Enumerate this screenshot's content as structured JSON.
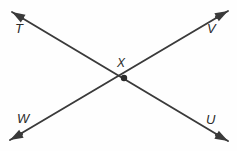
{
  "figure": {
    "type": "geometry-diagram",
    "background_color": "#fefefe",
    "stroke_color": "#3a3a3a",
    "label_color": "#2b2b2b",
    "canvas": {
      "width": 237,
      "height": 151
    },
    "intersection": {
      "label": "X",
      "point_name": "intersection-point",
      "x": 124,
      "y": 78,
      "dot_radius": 3.2
    },
    "lines": [
      {
        "name": "line-TU",
        "from_label": "T",
        "to_label": "U",
        "from": {
          "x": 12,
          "y": 12
        },
        "to": {
          "x": 228,
          "y": 141
        },
        "arrow_both_ends": true
      },
      {
        "name": "line-WV",
        "from_label": "W",
        "to_label": "V",
        "from": {
          "x": 10,
          "y": 140
        },
        "to": {
          "x": 228,
          "y": 11
        },
        "arrow_both_ends": true
      }
    ],
    "endpoints": [
      {
        "name": "endpoint-T",
        "label": "T",
        "corner": "top-left",
        "dot_x": 22,
        "dot_y": 18,
        "tip_x": 12,
        "tip_y": 12
      },
      {
        "name": "endpoint-V",
        "label": "V",
        "corner": "top-right",
        "dot_x": 217,
        "dot_y": 17,
        "tip_x": 228,
        "tip_y": 11
      },
      {
        "name": "endpoint-W",
        "label": "W",
        "corner": "bottom-left",
        "dot_x": 21,
        "dot_y": 134,
        "tip_x": 10,
        "tip_y": 140
      },
      {
        "name": "endpoint-U",
        "label": "U",
        "corner": "bottom-right",
        "dot_x": 217,
        "dot_y": 135,
        "tip_x": 228,
        "tip_y": 141
      }
    ],
    "labels": {
      "t": "T",
      "v": "V",
      "w": "W",
      "u": "U",
      "x": "X"
    }
  }
}
